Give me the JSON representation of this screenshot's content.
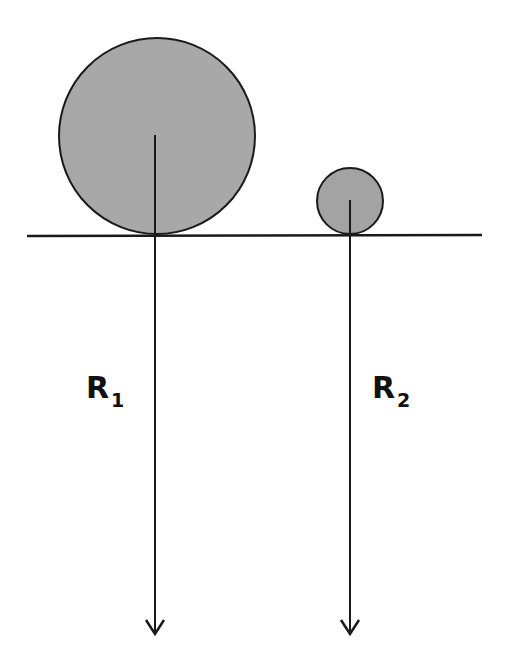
{
  "diagram": {
    "colors": {
      "circle_fill": "#a8a8a8",
      "stroke": "#1a1a1a",
      "background": "#ffffff"
    },
    "ground_line": {
      "x1": 27,
      "y1": 236,
      "x2": 482,
      "y2": 235
    },
    "circles": [
      {
        "name": "large-circle",
        "cx": 157,
        "cy": 136,
        "r": 98
      },
      {
        "name": "small-circle",
        "cx": 350,
        "cy": 201,
        "r": 33
      }
    ],
    "arrows": [
      {
        "name": "radius-arrow-1",
        "x": 155,
        "y_start": 135,
        "y_end": 634
      },
      {
        "name": "radius-arrow-2",
        "x": 350,
        "y_start": 200,
        "y_end": 634
      }
    ],
    "labels": [
      {
        "main": "R",
        "sub": "1"
      },
      {
        "main": "R",
        "sub": "2"
      }
    ]
  }
}
